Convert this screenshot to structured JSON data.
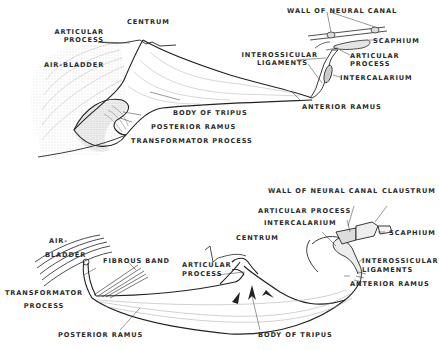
{
  "figure": {
    "top_panel": {
      "labels": {
        "centrum": "CENTRUM",
        "articular_process_l1": "ARTICULAR",
        "articular_process_l2": "PROCESS",
        "air_bladder": "AIR-BLADDER",
        "body_of_tripus": "BODY OF TRIPUS",
        "posterior_ramus": "POSTERIOR RAMUS",
        "transformator_process": "TRANSFORMATOR PROCESS",
        "wall_of_neural_canal": "WALL OF NEURAL CANAL",
        "scaphium": "SCAPHIUM",
        "articular_process_r_l1": "ARTICULAR",
        "articular_process_r_l2": "PROCESS",
        "interossicular_l1": "INTEROSSICULAR",
        "interossicular_l2": "LIGAMENTS",
        "intercalarium": "INTERCALARIUM",
        "anterior_ramus": "ANTERIOR RAMUS"
      }
    },
    "bottom_panel": {
      "labels": {
        "wall_of_neural_canal": "WALL OF NEURAL CANAL",
        "claustrum": "CLAUSTRUM",
        "articular_process_top": "ARTICULAR PROCESS",
        "intercalarium": "INTERCALARIUM",
        "scaphium": "SCAPHIUM",
        "centrum": "CENTRUM",
        "air_bladder_l1": "AIR-",
        "air_bladder_l2": "BLADDER",
        "fibrous_band": "FIBROUS BAND",
        "articular_process_l1": "ARTICULAR",
        "articular_process_l2": "PROCESS",
        "interossicular_l1": "INTEROSSICULAR",
        "interossicular_l2": "LIGAMENTS",
        "anterior_ramus": "ANTERIOR RAMUS",
        "transformator_l1": "TRANSFORMATOR",
        "transformator_l2": "PROCESS",
        "posterior_ramus": "POSTERIOR RAMUS",
        "body_of_tripus": "BODY OF TRIPUS"
      }
    }
  }
}
